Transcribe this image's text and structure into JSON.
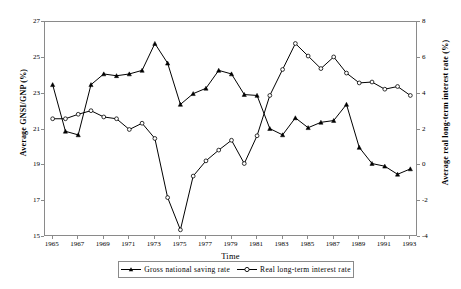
{
  "chart_data": {
    "type": "line",
    "title": "",
    "xlabel": "Time",
    "ylabel": "Average GNSI/GNP (%)",
    "y2label": "Average real long-term interest rate (%)",
    "x": [
      1965,
      1966,
      1967,
      1968,
      1969,
      1970,
      1971,
      1972,
      1973,
      1974,
      1975,
      1976,
      1977,
      1978,
      1979,
      1980,
      1981,
      1982,
      1983,
      1984,
      1985,
      1986,
      1987,
      1988,
      1989,
      1990,
      1991,
      1992,
      1993
    ],
    "xlim": [
      1964.4,
      1993.6
    ],
    "xticks": [
      1965,
      1967,
      1969,
      1971,
      1973,
      1975,
      1977,
      1979,
      1981,
      1983,
      1985,
      1987,
      1989,
      1991,
      1993
    ],
    "xtick_labels": [
      "1965",
      "1967",
      "1969",
      "1971",
      "1973",
      "1975",
      "1977",
      "1979",
      "1981",
      "1983",
      "1985",
      "1987",
      "1989",
      "1991",
      "1993"
    ],
    "ylim": [
      15,
      27
    ],
    "yticks": [
      15,
      17,
      19,
      21,
      23,
      25,
      27
    ],
    "ytick_labels": [
      "15",
      "17",
      "19",
      "21",
      "23",
      "25",
      "27"
    ],
    "y2lim": [
      -4,
      8
    ],
    "y2ticks": [
      -4,
      -2,
      0,
      2,
      4,
      6,
      8
    ],
    "y2tick_labels": [
      "-4",
      "-2",
      "0",
      "2",
      "4",
      "6",
      "8"
    ],
    "grid": false,
    "legend_position": "bottom",
    "series": [
      {
        "name": "Gross national saving rate",
        "axis": "left",
        "marker": "filled-triangle",
        "color": "#000000",
        "values": [
          23.5,
          20.9,
          20.7,
          23.5,
          24.1,
          24.0,
          24.1,
          24.3,
          25.8,
          24.7,
          22.4,
          23.0,
          23.3,
          24.3,
          24.1,
          22.95,
          22.9,
          21.05,
          20.7,
          21.65,
          21.1,
          21.4,
          21.5,
          22.4,
          20.0,
          19.1,
          18.95,
          18.5,
          18.8
        ]
      },
      {
        "name": "Real long-term interest rate",
        "axis": "right",
        "marker": "open-circle",
        "color": "#000000",
        "values": [
          2.6,
          2.6,
          2.85,
          3.05,
          2.7,
          2.6,
          2.0,
          2.35,
          1.5,
          -1.8,
          -3.6,
          -0.6,
          0.25,
          0.85,
          1.4,
          0.1,
          1.65,
          3.9,
          5.35,
          6.8,
          6.1,
          5.4,
          6.05,
          5.15,
          4.6,
          4.65,
          4.25,
          4.4,
          3.9
        ]
      }
    ]
  },
  "legend": {
    "entries": [
      {
        "label": "Gross national saving rate",
        "marker": "filled-triangle-line"
      },
      {
        "label": "Real long-term interest rate",
        "marker": "open-circle-line"
      }
    ]
  }
}
